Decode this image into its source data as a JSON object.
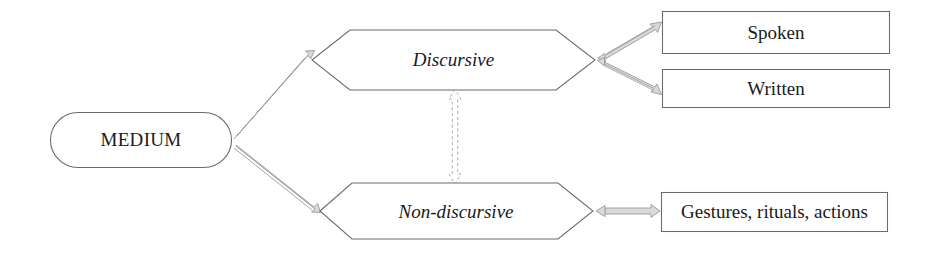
{
  "diagram": {
    "colors": {
      "node_stroke": "#6b6b6b",
      "node_fill": "#ffffff",
      "arrow_stroke": "#9a9a9a",
      "arrow_fill": "#d9d9d9",
      "text": "#1a1a1a",
      "background": "#ffffff"
    },
    "nodes": {
      "root": {
        "label": "MEDIUM",
        "shape": "rounded-rectangle"
      },
      "discursive": {
        "label": "Discursive",
        "shape": "hexagon",
        "style": "italic"
      },
      "non_discursive": {
        "label": "Non-discursive",
        "shape": "hexagon",
        "style": "italic"
      },
      "spoken": {
        "label": "Spoken",
        "shape": "rectangle"
      },
      "written": {
        "label": "Written",
        "shape": "rectangle"
      },
      "gestures": {
        "label": "Gestures, rituals, actions",
        "shape": "rectangle"
      }
    },
    "edges": [
      {
        "from": "MEDIUM",
        "to": "Discursive",
        "style": "solid",
        "heads": "single"
      },
      {
        "from": "MEDIUM",
        "to": "Non-discursive",
        "style": "solid",
        "heads": "single"
      },
      {
        "from": "Discursive",
        "to": "Spoken",
        "style": "solid",
        "heads": "double"
      },
      {
        "from": "Discursive",
        "to": "Written",
        "style": "solid",
        "heads": "double"
      },
      {
        "from": "Non-discursive",
        "to": "Gestures, rituals, actions",
        "style": "solid",
        "heads": "double"
      },
      {
        "from": "Discursive",
        "to": "Non-discursive",
        "style": "dashed",
        "heads": "double"
      }
    ]
  }
}
